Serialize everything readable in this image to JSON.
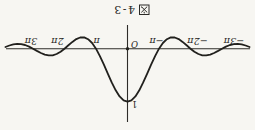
{
  "figure": {
    "caption": {
      "text": "図 4-3",
      "prefix": "図",
      "number": "4-3"
    }
  },
  "chart_data": {
    "type": "line",
    "function": "y = sin(x)/x (sinc), peak value 1 at origin",
    "x_unit": "pi",
    "xlim": [
      -3.875,
      3.875
    ],
    "ylim": [
      -0.25,
      1.1
    ],
    "grid": false,
    "origin_label": "O",
    "y_peak_label": "1",
    "curve_color": "#21201d",
    "axis_color": "#2e2c29",
    "background": "#f7f6f2",
    "x_ticks": [
      {
        "u": -3,
        "label": "−3π",
        "dx": -12
      },
      {
        "u": -2,
        "label": "−2π",
        "dx": -7
      },
      {
        "u": -1,
        "label": "−π",
        "dx": 2.5
      },
      {
        "u": 1,
        "label": "π",
        "dx": -0.5
      },
      {
        "u": 2,
        "label": "2π",
        "dx": 7
      },
      {
        "u": 3,
        "label": "3π",
        "dx": 2
      }
    ],
    "samples": [
      [
        -3.875,
        -0.0314
      ],
      [
        -3.75,
        -0.06
      ],
      [
        -3.625,
        -0.0811
      ],
      [
        -3.5,
        -0.0909
      ],
      [
        -3.375,
        -0.0871
      ],
      [
        -3.25,
        -0.0693
      ],
      [
        -3.125,
        -0.039
      ],
      [
        -3,
        0
      ],
      [
        -2.875,
        0.0424
      ],
      [
        -2.75,
        0.0818
      ],
      [
        -2.625,
        0.112
      ],
      [
        -2.5,
        0.1273
      ],
      [
        -2.375,
        0.1238
      ],
      [
        -2.25,
        0.1
      ],
      [
        -2.125,
        0.0573
      ],
      [
        -2,
        0
      ],
      [
        -1.875,
        -0.065
      ],
      [
        -1.75,
        -0.1286
      ],
      [
        -1.625,
        -0.181
      ],
      [
        -1.5,
        -0.2122
      ],
      [
        -1.375,
        -0.2139
      ],
      [
        -1.25,
        -0.1801
      ],
      [
        -1.125,
        -0.1083
      ],
      [
        -1,
        0
      ],
      [
        -0.875,
        0.1392
      ],
      [
        -0.75,
        0.3001
      ],
      [
        -0.625,
        0.4705
      ],
      [
        -0.5,
        0.6366
      ],
      [
        -0.375,
        0.7842
      ],
      [
        -0.25,
        0.9003
      ],
      [
        -0.125,
        0.9745
      ],
      [
        0,
        1
      ],
      [
        0.125,
        0.9745
      ],
      [
        0.25,
        0.9003
      ],
      [
        0.375,
        0.7842
      ],
      [
        0.5,
        0.6366
      ],
      [
        0.625,
        0.4705
      ],
      [
        0.75,
        0.3001
      ],
      [
        0.875,
        0.1392
      ],
      [
        1,
        0
      ],
      [
        1.125,
        -0.1083
      ],
      [
        1.25,
        -0.1801
      ],
      [
        1.375,
        -0.2139
      ],
      [
        1.5,
        -0.2122
      ],
      [
        1.625,
        -0.181
      ],
      [
        1.75,
        -0.1286
      ],
      [
        1.875,
        -0.065
      ],
      [
        2,
        0
      ],
      [
        2.125,
        0.0573
      ],
      [
        2.25,
        0.1
      ],
      [
        2.375,
        0.1238
      ],
      [
        2.5,
        0.1273
      ],
      [
        2.625,
        0.112
      ],
      [
        2.75,
        0.0818
      ],
      [
        2.875,
        0.0424
      ],
      [
        3,
        0
      ],
      [
        3.125,
        -0.039
      ],
      [
        3.25,
        -0.0693
      ],
      [
        3.375,
        -0.0871
      ],
      [
        3.5,
        -0.0909
      ],
      [
        3.625,
        -0.0811
      ],
      [
        3.75,
        -0.06
      ],
      [
        3.875,
        -0.0314
      ]
    ]
  }
}
